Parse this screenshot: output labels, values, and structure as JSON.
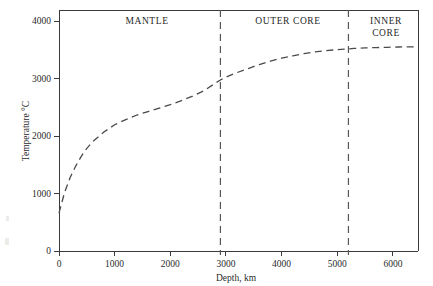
{
  "chart_data": {
    "type": "line",
    "title": "",
    "subtitle": "",
    "xlabel": "Depth, km",
    "ylabel": "Temperature °C",
    "xlim": [
      0,
      6450
    ],
    "ylim": [
      0,
      4200
    ],
    "xticks": [
      0,
      1000,
      2000,
      3000,
      4000,
      5000,
      6000
    ],
    "xticklabels": [
      "0",
      "1000",
      "2000",
      "3000",
      "4000",
      "5000",
      "6000"
    ],
    "yticks": [
      0,
      1000,
      2000,
      3000,
      4000
    ],
    "yticklabels": [
      "0",
      "1000",
      "2000",
      "3000",
      "4000"
    ],
    "grid": false,
    "legend": "none",
    "series": [
      {
        "name": "Geotherm",
        "style": "dashed",
        "x": [
          0,
          100,
          200,
          300,
          400,
          500,
          600,
          800,
          1000,
          1200,
          1400,
          1600,
          1800,
          2000,
          2200,
          2400,
          2600,
          2800,
          2900,
          3000,
          3200,
          3400,
          3600,
          3800,
          4000,
          4200,
          4400,
          4600,
          4800,
          5000,
          5150,
          5300,
          5500,
          5700,
          5900,
          6100,
          6300,
          6450
        ],
        "y": [
          660,
          1020,
          1280,
          1480,
          1650,
          1790,
          1900,
          2070,
          2200,
          2290,
          2370,
          2430,
          2490,
          2550,
          2620,
          2700,
          2790,
          2920,
          2980,
          3030,
          3110,
          3180,
          3250,
          3310,
          3360,
          3400,
          3440,
          3470,
          3490,
          3510,
          3520,
          3530,
          3540,
          3545,
          3550,
          3555,
          3558,
          3560
        ]
      }
    ],
    "annotations": [
      {
        "label": "MANTLE",
        "x_center": 1450,
        "type": "region-label"
      },
      {
        "label": "OUTER CORE",
        "x_center": 4120,
        "type": "region-label"
      },
      {
        "label": "INNER CORE",
        "line1": "INNER",
        "line2": "CORE",
        "x_center": 5880,
        "type": "region-label"
      }
    ],
    "boundaries": [
      {
        "name": "mantle-outer-core-boundary",
        "x": 2900,
        "style": "dashed"
      },
      {
        "name": "outer-core-inner-core-boundary",
        "x": 5200,
        "style": "dashed"
      }
    ]
  },
  "axes": {
    "x_title": "Depth, km",
    "y_title": "Temperature °C",
    "x_tick_labels": [
      "0",
      "1000",
      "2000",
      "3000",
      "4000",
      "5000",
      "6000"
    ],
    "y_tick_labels": [
      "0",
      "1000",
      "2000",
      "3000",
      "4000"
    ]
  },
  "regions": {
    "mantle": "MANTLE",
    "outer_core": "OUTER CORE",
    "inner_core_line1": "INNER",
    "inner_core_line2": "CORE"
  },
  "colors": {
    "axis": "#3a3a3a",
    "curve": "#4a4a4a",
    "boundary": "#55565a",
    "text": "#2b2b2b",
    "background": "#ffffff"
  }
}
